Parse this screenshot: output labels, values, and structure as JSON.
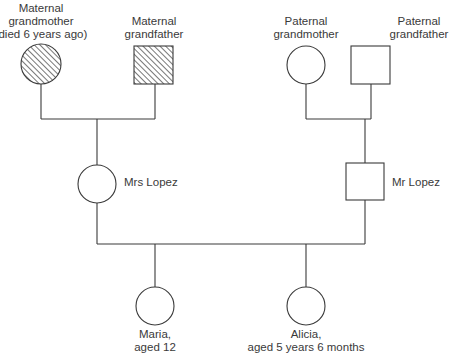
{
  "diagram": {
    "type": "genogram",
    "people": {
      "maternal_grandmother": {
        "line1": "Maternal",
        "line2": "grandmother",
        "line3": "(died 6 years ago)",
        "shape": "circle",
        "fill": "hatched"
      },
      "maternal_grandfather": {
        "line1": "Maternal",
        "line2": "grandfather",
        "shape": "square",
        "fill": "hatched"
      },
      "paternal_grandmother": {
        "line1": "Paternal",
        "line2": "grandmother",
        "shape": "circle",
        "fill": "none"
      },
      "paternal_grandfather": {
        "line1": "Paternal",
        "line2": "grandfather",
        "shape": "square",
        "fill": "none"
      },
      "mrs_lopez": {
        "label": "Mrs Lopez",
        "shape": "circle",
        "fill": "none"
      },
      "mr_lopez": {
        "label": "Mr Lopez",
        "shape": "square",
        "fill": "none"
      },
      "maria": {
        "line1": "Maria,",
        "line2": "aged 12",
        "shape": "circle",
        "fill": "none"
      },
      "alicia": {
        "line1": "Alicia,",
        "line2": "aged 5 years 6 months",
        "shape": "circle",
        "fill": "none"
      }
    },
    "relationships": [
      {
        "type": "marriage",
        "between": [
          "maternal_grandmother",
          "maternal_grandfather"
        ],
        "child": "mrs_lopez"
      },
      {
        "type": "marriage",
        "between": [
          "paternal_grandmother",
          "paternal_grandfather"
        ],
        "child": "mr_lopez"
      },
      {
        "type": "marriage",
        "between": [
          "mrs_lopez",
          "mr_lopez"
        ],
        "children": [
          "maria",
          "alicia"
        ]
      }
    ],
    "legend_note": "Hatched symbols indicate deceased/affected",
    "stroke_color": "#3a3a3a",
    "hatch_color": "#555555"
  }
}
